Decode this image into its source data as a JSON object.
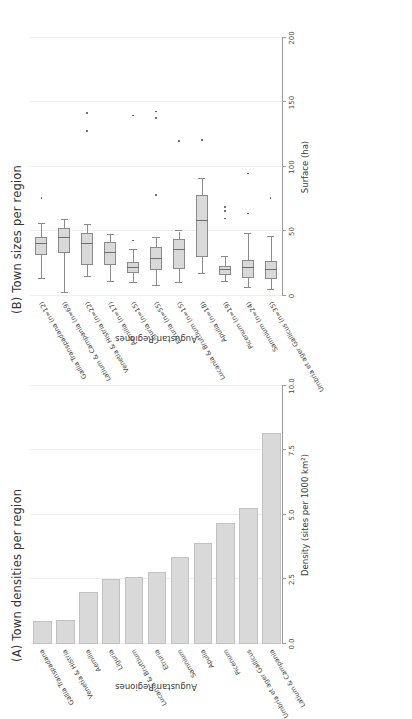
{
  "figure": {
    "panel_a_title": "(A) Town densities per region",
    "panel_b_title": "(B) Town sizes per region",
    "x_axis_title": "Augustan Regiones",
    "panel_a_y_title": "Density (sites per 1000 km²)",
    "panel_b_y_title": "Surface (ha)",
    "colors": {
      "bar_fill": "#d9d9d9",
      "bar_stroke": "#c2c2c2",
      "box_fill": "#d9d9d9",
      "box_stroke": "#8a8a8a",
      "grid": "#eeeeee",
      "axis": "#9a9a9a",
      "text": "#3c3c3c"
    }
  },
  "chart_data": [
    {
      "type": "bar",
      "title": "(A) Town densities per region",
      "xlabel": "Augustan Regiones",
      "ylabel": "Density (sites per 1000 km²)",
      "ylim": [
        0.0,
        10.0
      ],
      "yticks": [
        "0.0",
        "2.5",
        "5.0",
        "7.5",
        "10.0"
      ],
      "ytick_values": [
        0.0,
        2.5,
        5.0,
        7.5,
        10.0
      ],
      "grid": true,
      "legend": "none",
      "orientation": "horizontal",
      "categories": [
        "Latium & Campania",
        "Umbria et ager Gallicus",
        "Picenum",
        "Apulia",
        "Samnium",
        "Etruria",
        "Lucania & Bruttium",
        "Liguria",
        "Aemilia",
        "Venetia & Histria",
        "Gallia Transpadana"
      ],
      "values": [
        8.1,
        5.2,
        4.6,
        3.85,
        3.3,
        2.7,
        2.5,
        2.45,
        1.95,
        0.85,
        0.8
      ]
    },
    {
      "type": "box",
      "title": "(B) Town sizes per region",
      "xlabel": "Augustan Regiones",
      "ylabel": "Surface (ha)",
      "ylim": [
        0,
        200
      ],
      "yticks": [
        "0",
        "50",
        "100",
        "150",
        "200"
      ],
      "ytick_values": [
        0,
        50,
        100,
        150,
        200
      ],
      "grid": true,
      "legend": "none",
      "orientation": "horizontal",
      "categories": [
        "Umbria et ager Gallicus (n=35)",
        "Samnium (n=24)",
        "Picenum (n=19)",
        "Apulia (n=18)",
        "Lucania & Bruttium (n=15)",
        "Etruria (n=55)",
        "Liguria (n=15)",
        "Aemilia (n=17)",
        "Venetia & Histria (n=22)",
        "Latium & Campania (n=69)",
        "Gallia Transpadana (n=12)"
      ],
      "boxes": [
        {
          "region": "Umbria et ager Gallicus (n=35)",
          "n": 35,
          "whisker_low": 5,
          "q1": 13,
          "median": 20,
          "q3": 27,
          "whisker_high": 46,
          "outliers": [
            76
          ]
        },
        {
          "region": "Samnium (n=24)",
          "n": 24,
          "whisker_low": 6,
          "q1": 14,
          "median": 22,
          "q3": 28,
          "whisker_high": 48,
          "outliers": [
            64,
            95
          ]
        },
        {
          "region": "Picenum (n=19)",
          "n": 19,
          "whisker_low": 11,
          "q1": 16,
          "median": 20,
          "q3": 23,
          "whisker_high": 30,
          "outliers": [
            60,
            66,
            69
          ]
        },
        {
          "region": "Apulia (n=18)",
          "n": 18,
          "whisker_low": 17,
          "q1": 30,
          "median": 58,
          "q3": 78,
          "whisker_high": 91,
          "outliers": [
            121
          ]
        },
        {
          "region": "Lucania & Bruttium (n=15)",
          "n": 15,
          "whisker_low": 10,
          "q1": 21,
          "median": 36,
          "q3": 44,
          "whisker_high": 50,
          "outliers": [
            120
          ]
        },
        {
          "region": "Etruria (n=55)",
          "n": 55,
          "whisker_low": 8,
          "q1": 20,
          "median": 29,
          "q3": 38,
          "whisker_high": 45,
          "outliers": [
            78,
            138,
            143
          ]
        },
        {
          "region": "Liguria (n=15)",
          "n": 15,
          "whisker_low": 10,
          "q1": 18,
          "median": 22,
          "q3": 26,
          "whisker_high": 36,
          "outliers": [
            43,
            140
          ]
        },
        {
          "region": "Aemilia (n=17)",
          "n": 17,
          "whisker_low": 11,
          "q1": 24,
          "median": 33,
          "q3": 42,
          "whisker_high": 47,
          "outliers": []
        },
        {
          "region": "Venetia & Histria (n=22)",
          "n": 22,
          "whisker_low": 15,
          "q1": 24,
          "median": 40,
          "q3": 49,
          "whisker_high": 55,
          "outliers": [
            128,
            142
          ]
        },
        {
          "region": "Latium & Campania (n=69)",
          "n": 69,
          "whisker_low": 2,
          "q1": 33,
          "median": 45,
          "q3": 53,
          "whisker_high": 59,
          "outliers": []
        },
        {
          "region": "Gallia Transpadana (n=12)",
          "n": 12,
          "whisker_low": 13,
          "q1": 32,
          "median": 40,
          "q3": 46,
          "whisker_high": 56,
          "outliers": [
            76
          ]
        }
      ]
    }
  ]
}
